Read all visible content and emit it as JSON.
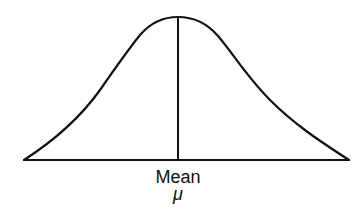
{
  "diagram": {
    "type": "normal-distribution-curve",
    "labels": {
      "mean": "Mean",
      "mu": "μ"
    },
    "colors": {
      "stroke": "#111111",
      "background": "#ffffff"
    }
  }
}
